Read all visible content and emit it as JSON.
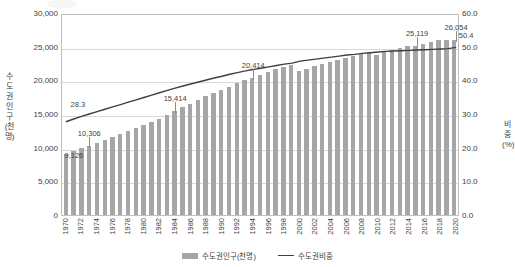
{
  "chart_data": {
    "type": "bar",
    "title": "",
    "xlabel": "",
    "ylabel": "수도권인구(천명)",
    "y2label": "비중(%)",
    "ylim": [
      0,
      30000
    ],
    "y2lim": [
      0,
      60.0
    ],
    "grid": true,
    "legend_position": "bottom",
    "yticks": [
      "30,000",
      "25,000",
      "20,000",
      "15,000",
      "10,000",
      "5,000",
      "0"
    ],
    "ytick_values": [
      30000,
      25000,
      20000,
      15000,
      10000,
      5000,
      0
    ],
    "y2ticks": [
      "60.0",
      "50.0",
      "40.0",
      "30.0",
      "20.0",
      "10.0",
      "0.0"
    ],
    "y2tick_values": [
      60.0,
      50.0,
      40.0,
      30.0,
      20.0,
      10.0,
      0.0
    ],
    "categories": [
      1970,
      1971,
      1972,
      1973,
      1974,
      1975,
      1976,
      1977,
      1978,
      1979,
      1980,
      1981,
      1982,
      1983,
      1984,
      1985,
      1986,
      1987,
      1988,
      1989,
      1990,
      1991,
      1992,
      1993,
      1994,
      1995,
      1996,
      1997,
      1998,
      1999,
      2000,
      2001,
      2002,
      2003,
      2004,
      2005,
      2006,
      2007,
      2008,
      2009,
      2010,
      2011,
      2012,
      2013,
      2014,
      2015,
      2016,
      2017,
      2018,
      2019,
      2020
    ],
    "xtick_labels": [
      "1970",
      "",
      "1972",
      "",
      "1974",
      "",
      "1976",
      "",
      "1978",
      "",
      "1980",
      "",
      "1982",
      "",
      "1984",
      "",
      "1986",
      "",
      "1988",
      "",
      "1990",
      "",
      "1992",
      "",
      "1994",
      "",
      "1996",
      "",
      "1998",
      "",
      "2000",
      "",
      "2002",
      "",
      "2004",
      "",
      "2006",
      "",
      "2008",
      "",
      "2010",
      "",
      "2012",
      "",
      "2014",
      "",
      "2016",
      "",
      "2018",
      "",
      "2020"
    ],
    "series": [
      {
        "name": "수도권인구(천명)",
        "type": "bar",
        "color": "#a6a6a6",
        "axis": "left",
        "values": [
          9126,
          9460,
          9935,
          10306,
          10760,
          11186,
          11600,
          12030,
          12480,
          12970,
          13298,
          13800,
          14280,
          14820,
          15414,
          15980,
          16540,
          17090,
          17640,
          18180,
          18586,
          19080,
          19570,
          20000,
          20414,
          20857,
          21270,
          21680,
          22020,
          22330,
          21354,
          21740,
          22080,
          22410,
          22740,
          23050,
          23350,
          23640,
          23900,
          24150,
          23836,
          24200,
          24530,
          24780,
          25036,
          25119,
          25459,
          25737,
          25953,
          26013,
          26054
        ]
      },
      {
        "name": "수도권비중",
        "type": "line",
        "color": "#3f3f3f",
        "axis": "right",
        "values": [
          28.3,
          29.1,
          29.9,
          30.6,
          31.3,
          32.0,
          32.7,
          33.4,
          34.1,
          34.8,
          35.5,
          36.2,
          36.9,
          37.6,
          38.3,
          38.9,
          39.5,
          40.1,
          40.7,
          41.3,
          41.8,
          42.4,
          42.9,
          43.4,
          43.8,
          44.2,
          44.6,
          45.0,
          45.4,
          45.7,
          46.3,
          46.6,
          46.9,
          47.2,
          47.5,
          47.8,
          48.1,
          48.3,
          48.6,
          48.8,
          49.0,
          49.2,
          49.3,
          49.4,
          49.5,
          49.6,
          49.7,
          49.8,
          49.9,
          50.0,
          50.4
        ]
      }
    ],
    "annotations": [
      {
        "label": "28.3",
        "year": 1970,
        "series": "수도권비중",
        "value": 28.3
      },
      {
        "label": "9,126",
        "year": 1970,
        "series": "수도권인구(천명)",
        "value": 9126
      },
      {
        "label": "10,306",
        "year": 1973,
        "series": "수도권인구(천명)",
        "value": 10306
      },
      {
        "label": "15,414",
        "year": 1984,
        "series": "수도권인구(천명)",
        "value": 15414
      },
      {
        "label": "20,414",
        "year": 1994,
        "series": "수도권인구(천명)",
        "value": 20414
      },
      {
        "label": "25,119",
        "year": 2015,
        "series": "수도권인구(천명)",
        "value": 25119
      },
      {
        "label": "26,054",
        "year": 2020,
        "series": "수도권인구(천명)",
        "value": 26054
      },
      {
        "label": "50.4",
        "year": 2020,
        "series": "수도권비중",
        "value": 50.4
      }
    ]
  },
  "legend": {
    "items": [
      {
        "label": "수도권인구(천명)",
        "marker": "bar-swatch",
        "color": "#a6a6a6"
      },
      {
        "label": "수도권비중",
        "marker": "line-swatch",
        "color": "#3f3f3f"
      }
    ]
  },
  "colors": {
    "bar": "#a6a6a6",
    "line": "#3f3f3f",
    "grid": "#d9d9d9",
    "axis": "#bfbfbf",
    "text": "#404040",
    "background": "#ffffff"
  }
}
